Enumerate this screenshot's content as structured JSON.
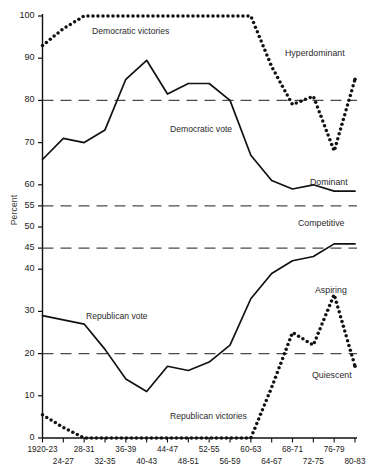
{
  "chart_data": {
    "type": "line",
    "title": "",
    "xlabel": "",
    "ylabel": "Percent",
    "ylim": [
      0,
      100
    ],
    "grid": false,
    "legend_position": "inline-annotations",
    "categories": [
      "1920-23",
      "24-27",
      "28-31",
      "32-35",
      "36-39",
      "40-43",
      "44-47",
      "48-51",
      "52-55",
      "56-59",
      "60-63",
      "64-67",
      "68-71",
      "72-75",
      "76-79",
      "80-83"
    ],
    "y_ticks": [
      0,
      10,
      20,
      30,
      40,
      45,
      50,
      55,
      60,
      70,
      80,
      90,
      100
    ],
    "reference_lines": [
      {
        "value": 80,
        "style": "dashed",
        "label": "Hyperdominant"
      },
      {
        "value": 55,
        "style": "dashed",
        "label": "Dominant"
      },
      {
        "value": 45,
        "style": "dashed",
        "label": "Competitive"
      },
      {
        "value": 20,
        "style": "dashed",
        "label": "Aspiring"
      }
    ],
    "series": [
      {
        "name": "Democratic victories",
        "style": "dotted",
        "values": [
          93,
          97,
          100,
          100,
          100,
          100,
          100,
          100,
          100,
          100,
          100,
          88,
          79,
          81,
          68,
          85
        ]
      },
      {
        "name": "Democratic vote",
        "style": "solid",
        "values": [
          66,
          71,
          70,
          73,
          85,
          89.5,
          81.5,
          84,
          84,
          80,
          67,
          61,
          59,
          60,
          58.5,
          58.5
        ]
      },
      {
        "name": "Republican vote",
        "style": "solid",
        "values": [
          29,
          28,
          27,
          21,
          14,
          11,
          17,
          16,
          18,
          22,
          33,
          39,
          42,
          43,
          46,
          46
        ]
      },
      {
        "name": "Republican victories",
        "style": "dotted",
        "values": [
          5.5,
          2.5,
          0,
          0,
          0,
          0,
          0,
          0,
          0,
          0,
          0,
          12,
          25,
          22,
          34,
          17
        ]
      }
    ],
    "annotations": [
      {
        "text": "Democratic victories",
        "x_frac": 0.29,
        "y_value": 97
      },
      {
        "text": "Democratic vote",
        "x_frac": 0.48,
        "y_value": 72
      },
      {
        "text": "Republican vote",
        "x_frac": 0.24,
        "y_value": 28
      },
      {
        "text": "Republican victories",
        "x_frac": 0.6,
        "y_value": 4
      }
    ],
    "zone_labels": [
      "Hyperdominant",
      "Dominant",
      "Competitive",
      "Aspiring",
      "Quiescent"
    ]
  },
  "axis": {
    "y_title": "Percent",
    "y_tick_labels": [
      "100",
      "90",
      "80",
      "70",
      "60",
      "55",
      "50",
      "45",
      "40",
      "30",
      "20",
      "10",
      "0"
    ],
    "x_tick_labels_top": [
      "1920-23",
      "28-31",
      "36-39",
      "44-47",
      "52-55",
      "60-63",
      "68-71",
      "76-79"
    ],
    "x_tick_labels_bottom": [
      "24-27",
      "32-35",
      "40-43",
      "48-51",
      "56-59",
      "64-67",
      "72-75",
      "80-83"
    ]
  },
  "annotations": {
    "democratic_victories": "Democratic victories",
    "democratic_vote": "Democratic vote",
    "republican_vote": "Republican vote",
    "republican_victories": "Republican victories"
  },
  "zones": {
    "hyperdominant": "Hyperdominant",
    "dominant": "Dominant",
    "competitive": "Competitive",
    "aspiring": "Aspiring",
    "quiescent": "Quiescent"
  },
  "colors": {
    "ink": "#111111",
    "dash": "#4a4a4a",
    "background": "#ffffff"
  }
}
